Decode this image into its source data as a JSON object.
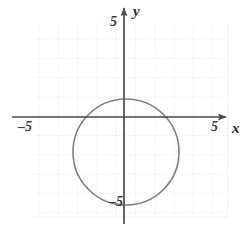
{
  "figure": {
    "name": "coordinate-plane-with-circle",
    "width": 244,
    "height": 231,
    "background_color": "#ffffff"
  },
  "axes": {
    "x_axis_label": "x",
    "y_axis_label": "y",
    "axis_color": "#4a4a4a",
    "grid_color": "#d9d9e3",
    "grid_visible": true,
    "origin_px": {
      "x": 124,
      "y": 117
    },
    "pixels_per_unit": 19.3,
    "ticks": {
      "x_right": "5",
      "x_left": "–5",
      "y_top": "5",
      "y_bottom": "–5"
    }
  },
  "chart_data": {
    "type": "scatter",
    "title": "",
    "xlabel": "x",
    "ylabel": "y",
    "xlim": [
      -5.7,
      5.7
    ],
    "ylim": [
      -5.7,
      5.7
    ],
    "xticks": [
      -5,
      5
    ],
    "yticks": [
      -5,
      5
    ],
    "xticklabels": [
      "–5",
      "5"
    ],
    "yticklabels": [
      "–5",
      "5"
    ],
    "grid": true,
    "legend": null,
    "series": [
      {
        "name": "circle",
        "type": "circle",
        "center": [
          0.1,
          -1.8
        ],
        "radius": 2.75,
        "equation": "x² + (y + 1.8)² = 2.75²",
        "color": "#7d7d85",
        "linewidth": 1.6,
        "center_px": [
          126,
          152
        ],
        "radius_px": 53
      }
    ],
    "annotations": []
  }
}
